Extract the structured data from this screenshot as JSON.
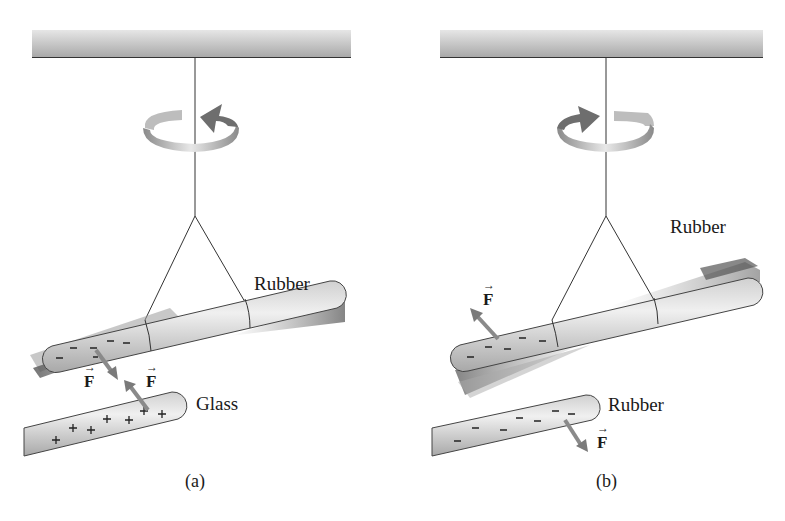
{
  "panels": [
    {
      "id": "a",
      "caption": "(a)",
      "rotation_direction": "counterclockwise",
      "suspended_rod": {
        "material": "Rubber",
        "charges": [
          "−",
          "−",
          "−",
          "−",
          "−",
          "−"
        ]
      },
      "nearby_rod": {
        "material": "Glass",
        "charges": [
          "+",
          "+",
          "+",
          "+",
          "+",
          "+",
          "+"
        ]
      },
      "force_labels": [
        "F",
        "F"
      ],
      "interaction": "attraction"
    },
    {
      "id": "b",
      "caption": "(b)",
      "rotation_direction": "clockwise",
      "suspended_rod": {
        "material": "Rubber",
        "charges": [
          "−",
          "−",
          "−",
          "−",
          "−"
        ]
      },
      "nearby_rod": {
        "material": "Rubber",
        "charges": [
          "−",
          "−",
          "−",
          "−",
          "−",
          "−",
          "−"
        ]
      },
      "force_labels": [
        "F",
        "F"
      ],
      "interaction": "repulsion"
    }
  ],
  "colors": {
    "rod_light": "#e4e4e4",
    "rod_mid": "#c6c6c6",
    "rod_dark": "#8e8e8e",
    "arrow": "#8a8a8a",
    "ceiling": "#bdbdbd",
    "line": "#2a2a2a"
  }
}
